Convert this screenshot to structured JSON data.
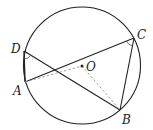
{
  "diagram": {
    "circle": {
      "cx": 82,
      "cy": 65.5,
      "r": 58.5
    },
    "points": {
      "A": {
        "x": 25,
        "y": 82,
        "label": "A",
        "lx": 13,
        "ly": 95
      },
      "B": {
        "x": 120,
        "y": 110,
        "label": "B",
        "lx": 122,
        "ly": 124
      },
      "C": {
        "x": 134,
        "y": 38,
        "label": "C",
        "lx": 137,
        "ly": 39
      },
      "D": {
        "x": 24,
        "y": 51,
        "label": "D",
        "lx": 11,
        "ly": 53
      },
      "O": {
        "x": 82,
        "y": 66,
        "label": "O",
        "lx": 86,
        "ly": 71
      }
    },
    "solid_segments": [
      [
        "D",
        "A"
      ],
      [
        "A",
        "C"
      ],
      [
        "C",
        "B"
      ],
      [
        "D",
        "B"
      ]
    ],
    "dashed_segments": [
      [
        "A",
        "O"
      ],
      [
        "O",
        "B"
      ]
    ],
    "angle_marks": [
      "D",
      "C"
    ],
    "colors": {
      "stroke": "#222222",
      "dashed": "#999999"
    }
  }
}
